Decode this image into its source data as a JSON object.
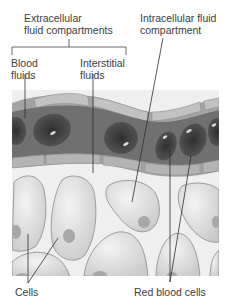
{
  "labels": {
    "extracellular_line1": "Extracellular",
    "extracellular_line2": "fluid compartments",
    "intracellular_line1": "Intracellular fluid",
    "intracellular_line2": "compartment",
    "blood_line1": "Blood",
    "blood_line2": "fluids",
    "interstitial_line1": "Interstitial",
    "interstitial_line2": "fluids",
    "cells": "Cells",
    "red_blood_cells": "Red blood cells"
  },
  "colors": {
    "background": "#ffffff",
    "vessel_wall": "#9a9a9a",
    "vessel_wall_light": "#b8b8b8",
    "plasma": "#6e6e6e",
    "rbc": "#4a4a4a",
    "interstitial": "#efefef",
    "cell_fill": "#d8d8d8",
    "cell_outline": "#8a8a8a",
    "nucleus": "#a9a9a9",
    "leader_line": "#333333"
  }
}
